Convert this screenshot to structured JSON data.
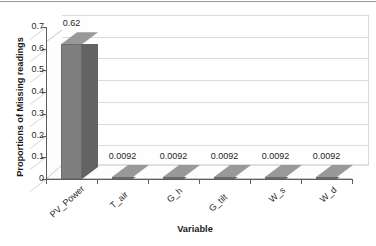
{
  "chart_data": {
    "type": "bar",
    "title": "",
    "subtitle": "",
    "xlabel": "Variable",
    "ylabel": "Proportions of Missing readings",
    "categories": [
      "PV_Power",
      "T_air",
      "G_h",
      "G_tilt",
      "W_s",
      "W_d"
    ],
    "values": [
      0.62,
      0.0092,
      0.0092,
      0.0092,
      0.0092,
      0.0092
    ],
    "data_labels": [
      "0.62",
      "0.0092",
      "0.0092",
      "0.0092",
      "0.0092",
      "0.0092"
    ],
    "ylim": [
      0,
      0.7
    ],
    "ytick_values": [
      0,
      0.1,
      0.2,
      0.3,
      0.4,
      0.5,
      0.6,
      0.7
    ],
    "ytick_labels": [
      "0",
      "0.1",
      "0.2",
      "0.3",
      "0.4",
      "0.5",
      "0.6",
      "0.7"
    ],
    "grid": true,
    "grid_axis": "y",
    "legend": false,
    "legend_position": "none",
    "style": "3d-column",
    "series": [
      {
        "name": "Proportions of Missing readings",
        "values": [
          0.62,
          0.0092,
          0.0092,
          0.0092,
          0.0092,
          0.0092
        ],
        "color": "#7F7F7F"
      }
    ],
    "colors": {
      "bar_front": "#7F7F7F",
      "bar_top": "#999999",
      "bar_side": "#636363",
      "gridline": "#DADADA",
      "axis": "#5D5D5D",
      "text": "#1F1F1F",
      "plot_background": "#FEFEFE"
    }
  }
}
